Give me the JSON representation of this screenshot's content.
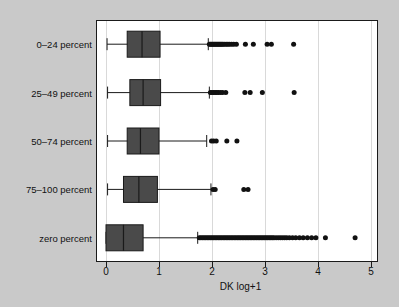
{
  "chart_data": {
    "type": "box",
    "orientation": "horizontal",
    "title": "",
    "xlabel": "DK log+1",
    "ylabel": "",
    "xlim": [
      -0.18,
      5.32
    ],
    "xticks": [
      0,
      1,
      2,
      3,
      4,
      5
    ],
    "xtick_labels": [
      "0",
      "1",
      "2",
      "3",
      "4",
      "5"
    ],
    "grid": "vertical",
    "legend": "none",
    "categories": [
      "0–24 percent",
      "25–49 percent",
      "50–74 percent",
      "75–100 percent",
      "zero percent"
    ],
    "boxes": [
      {
        "category": "0–24 percent",
        "whisker_low": 0.02,
        "q1": 0.4,
        "median": 0.68,
        "q3": 1.02,
        "whisker_high": 1.93,
        "outliers": [
          1.95,
          1.97,
          1.99,
          2.01,
          2.03,
          2.05,
          2.07,
          2.09,
          2.11,
          2.13,
          2.15,
          2.17,
          2.19,
          2.21,
          2.24,
          2.27,
          2.3,
          2.33,
          2.37,
          2.41,
          2.46,
          2.63,
          2.78,
          3.04,
          3.12,
          3.54
        ]
      },
      {
        "category": "25–49 percent",
        "whisker_low": 0.03,
        "q1": 0.45,
        "median": 0.7,
        "q3": 1.03,
        "whisker_high": 1.95,
        "outliers": [
          1.97,
          2.0,
          2.03,
          2.06,
          2.09,
          2.12,
          2.16,
          2.2,
          2.26,
          2.62,
          2.72,
          2.95,
          3.55
        ]
      },
      {
        "category": "50–74 percent",
        "whisker_low": 0.03,
        "q1": 0.4,
        "median": 0.65,
        "q3": 1.0,
        "whisker_high": 1.9,
        "outliers": [
          1.99,
          2.03,
          2.08,
          2.28,
          2.47
        ]
      },
      {
        "category": "75–100 percent",
        "whisker_low": 0.03,
        "q1": 0.33,
        "median": 0.62,
        "q3": 0.97,
        "whisker_high": 1.98,
        "outliers": [
          2.02,
          2.06,
          2.6,
          2.68
        ]
      },
      {
        "category": "zero percent",
        "whisker_low": 0.0,
        "q1": 0.0,
        "median": 0.33,
        "q3": 0.7,
        "whisker_high": 1.73,
        "outliers": [
          1.76,
          1.79,
          1.82,
          1.85,
          1.88,
          1.91,
          1.94,
          1.97,
          2.0,
          2.03,
          2.06,
          2.09,
          2.12,
          2.15,
          2.18,
          2.21,
          2.24,
          2.27,
          2.3,
          2.33,
          2.36,
          2.39,
          2.42,
          2.45,
          2.48,
          2.51,
          2.54,
          2.57,
          2.6,
          2.63,
          2.66,
          2.69,
          2.72,
          2.75,
          2.78,
          2.81,
          2.84,
          2.87,
          2.9,
          2.93,
          2.96,
          2.99,
          3.02,
          3.05,
          3.08,
          3.11,
          3.14,
          3.17,
          3.21,
          3.25,
          3.29,
          3.33,
          3.37,
          3.41,
          3.46,
          3.52,
          3.58,
          3.65,
          3.72,
          3.8,
          3.88,
          3.96,
          4.14,
          4.7
        ]
      }
    ],
    "colors": {
      "box_fill": "#4a4a4a",
      "box_edge": "#1a1a1a",
      "outlier": "#111111",
      "plot_background": "#ffffff",
      "figure_background": "#c9c9c9",
      "grid": "#d9d9d9"
    }
  }
}
